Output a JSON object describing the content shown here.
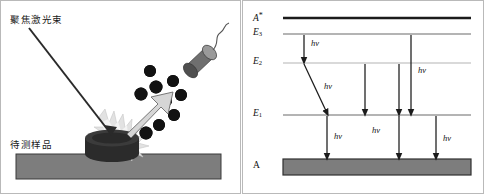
{
  "figure": {
    "panels": [
      "laser-ablation-schematic",
      "energy-level-diagram"
    ]
  },
  "left_panel": {
    "laser_label": "聚焦激光束",
    "sample_label": "待测样品",
    "colors": {
      "substrate": "#7d7d7d",
      "substrate_border": "#3a3a3a",
      "pellet": "#2b2b2b",
      "plume": "#d8d8d8",
      "particle": "#121212",
      "probe_body": "#6f6f6f",
      "probe_face": "#9a9a9a",
      "arrow_fill": "#d6d6d6",
      "arrow_border": "#6a6a6a",
      "beam": "#2a2a2a"
    },
    "particle_count": 9
  },
  "right_panel": {
    "levels": [
      {
        "id": "A-excited",
        "label": "A",
        "superscript": "*",
        "subscript": "",
        "y": 17,
        "color": "#1b1b1b",
        "thickness": 2.2
      },
      {
        "id": "E3",
        "label": "E",
        "superscript": "",
        "subscript": "3",
        "y": 33,
        "color": "#6b6b6b",
        "thickness": 1.2
      },
      {
        "id": "E2",
        "label": "E",
        "superscript": "",
        "subscript": "2",
        "y": 62,
        "color": "#b2b2b2",
        "thickness": 1.0
      },
      {
        "id": "E1",
        "label": "E",
        "superscript": "",
        "subscript": "1",
        "y": 114,
        "color": "#6b6b6b",
        "thickness": 1.2
      },
      {
        "id": "A-ground",
        "label": "A",
        "superscript": "",
        "subscript": "",
        "y": 166,
        "color": "#7d7d7d",
        "thickness": 0
      }
    ],
    "ground_band": {
      "fill": "#7d7d7d",
      "border": "#2f2f2f",
      "height": 16
    },
    "photon_label": "hv",
    "transitions": [
      {
        "id": "e3-to-e2",
        "from": "E3",
        "to": "E2",
        "x1": 303,
        "x2": 303,
        "labeled": true,
        "label_x": 310,
        "label_y": 41
      },
      {
        "id": "e2-to-e1-slanted",
        "from": "E2",
        "to": "E1",
        "x1": 303,
        "x2": 326,
        "labeled": true,
        "label_x": 324,
        "label_y": 84
      },
      {
        "id": "e2-to-e1-a",
        "from": "E2",
        "to": "E1",
        "x1": 364,
        "x2": 364,
        "labeled": false
      },
      {
        "id": "e2-to-e1-b",
        "from": "E2",
        "to": "E1",
        "x1": 398,
        "x2": 398,
        "labeled": false
      },
      {
        "id": "e3-to-e1",
        "from": "E3",
        "to": "E1",
        "x1": 410,
        "x2": 410,
        "labeled": true,
        "label_x": 417,
        "label_y": 70
      },
      {
        "id": "e1-to-a-left",
        "from": "E1",
        "to": "A",
        "x1": 326,
        "x2": 326,
        "labeled": true,
        "label_x": 333,
        "label_y": 139
      },
      {
        "id": "e1-to-a-mid",
        "from": "E1",
        "to": "A",
        "x1": 398,
        "x2": 398,
        "labeled": true,
        "label_x": 371,
        "label_y": 133
      },
      {
        "id": "e1-to-a-right",
        "from": "E1",
        "to": "A",
        "x1": 435,
        "x2": 435,
        "labeled": true,
        "label_x": 442,
        "label_y": 141
      }
    ],
    "arrow_color": "#1b1b1b"
  }
}
